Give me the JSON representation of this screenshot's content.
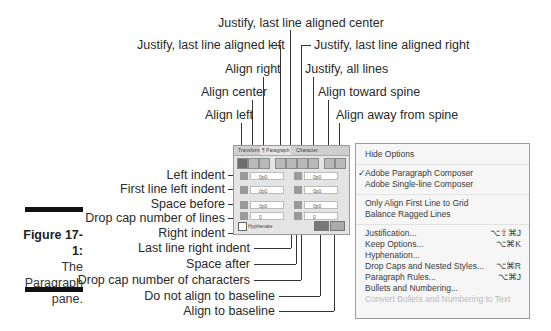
{
  "figure": {
    "number": "Figure 17-1:",
    "caption_lines": [
      "The",
      "Paragraph",
      "pane."
    ]
  },
  "callouts_top": [
    {
      "label": "Justify, last line aligned center"
    },
    {
      "label": "Justify, last line aligned left"
    },
    {
      "label": "Justify, last line aligned right"
    },
    {
      "label": "Align right"
    },
    {
      "label": "Justify, all lines"
    },
    {
      "label": "Align center"
    },
    {
      "label": "Align toward spine"
    },
    {
      "label": "Align left"
    },
    {
      "label": "Align away from spine"
    }
  ],
  "callouts_left": [
    {
      "label": "Left indent"
    },
    {
      "label": "First line left indent"
    },
    {
      "label": "Space before"
    },
    {
      "label": "Drop cap number of lines"
    },
    {
      "label": "Right indent"
    },
    {
      "label": "Last line right indent"
    },
    {
      "label": "Space after"
    },
    {
      "label": "Drop cap number of characters"
    },
    {
      "label": "Do not align to baseline"
    },
    {
      "label": "Align to baseline"
    }
  ],
  "panel": {
    "tabs": [
      "Transform",
      "¶ Paragraph",
      "Character"
    ],
    "active_tab": "¶ Paragraph",
    "fields": {
      "left_indent": "0p0",
      "first_line_indent": "0p0",
      "space_before": "0p0",
      "drop_cap_lines": "0",
      "right_indent": "0p0",
      "last_line_right_indent": "0p0",
      "space_after": "0p0",
      "drop_cap_chars": "0"
    },
    "hyphenate_label": "Hyphenate",
    "hyphenate_checked": true
  },
  "menu": {
    "items": [
      {
        "label": "Hide Options",
        "shortcut": ""
      },
      {
        "label": "Adobe Paragraph Composer",
        "shortcut": "",
        "checked": true
      },
      {
        "label": "Adobe Single-line Composer",
        "shortcut": ""
      },
      {
        "label": "Only Align First Line to Grid",
        "shortcut": ""
      },
      {
        "label": "Balance Ragged Lines",
        "shortcut": ""
      },
      {
        "label": "Justification...",
        "shortcut": "⌥⇧⌘J"
      },
      {
        "label": "Keep Options...",
        "shortcut": "⌥⌘K"
      },
      {
        "label": "Hyphenation...",
        "shortcut": ""
      },
      {
        "label": "Drop Caps and Nested Styles...",
        "shortcut": "⌥⌘R"
      },
      {
        "label": "Paragraph Rules...",
        "shortcut": "⌥⌘J"
      },
      {
        "label": "Bullets and Numbering...",
        "shortcut": ""
      },
      {
        "label": "Convert Bullets and Numbering to Text",
        "shortcut": "",
        "disabled": true
      }
    ],
    "check_mark": "✓"
  }
}
